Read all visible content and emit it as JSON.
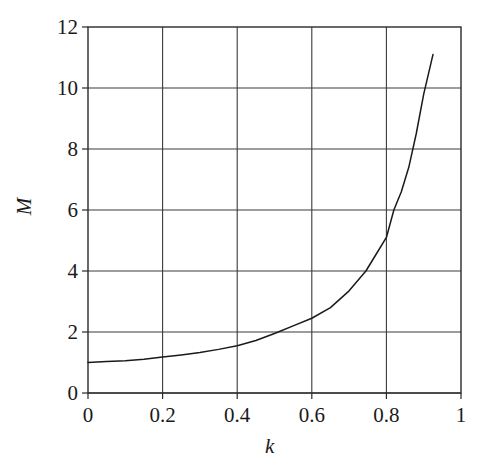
{
  "chart_data": {
    "type": "line",
    "title": "",
    "subtitle": "",
    "xlabel": "k",
    "ylabel": "M",
    "xlim": [
      0,
      1
    ],
    "ylim": [
      0,
      12
    ],
    "grid": true,
    "legend": false,
    "legend_position": "none",
    "xticks": [
      "0",
      "0.2",
      "0.4",
      "0.6",
      "0.8",
      "1"
    ],
    "xtick_values": [
      0,
      0.2,
      0.4,
      0.6,
      0.8,
      1
    ],
    "yticks": [
      "0",
      "2",
      "4",
      "6",
      "8",
      "10",
      "12"
    ],
    "ytick_values": [
      0,
      2,
      4,
      6,
      8,
      10,
      12
    ],
    "series": [
      {
        "name": "M(k)",
        "color": "#1a1a1a",
        "x": [
          0.0,
          0.05,
          0.1,
          0.15,
          0.2,
          0.25,
          0.3,
          0.35,
          0.4,
          0.45,
          0.5,
          0.51,
          0.55,
          0.6,
          0.65,
          0.7,
          0.745,
          0.77,
          0.8,
          0.82,
          0.84,
          0.86,
          0.88,
          0.9,
          0.925
        ],
        "y": [
          1.0,
          1.03,
          1.06,
          1.11,
          1.18,
          1.25,
          1.33,
          1.43,
          1.55,
          1.72,
          1.95,
          2.0,
          2.2,
          2.45,
          2.8,
          3.35,
          4.0,
          4.5,
          5.1,
          6.0,
          6.6,
          7.4,
          8.5,
          9.8,
          11.1
        ]
      }
    ],
    "annotations": []
  },
  "axes": {
    "y_label_text": "M",
    "x_label_text": "k"
  }
}
